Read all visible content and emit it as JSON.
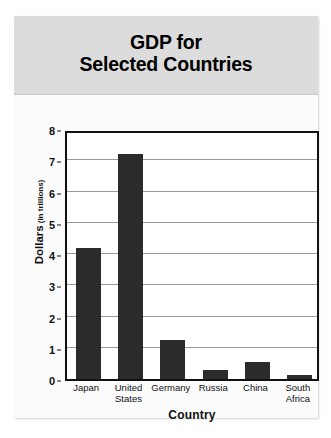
{
  "chart_data": {
    "type": "bar",
    "title": "GDP for Selected Countries",
    "title_line1": "GDP for",
    "title_line2": "Selected Countries",
    "xlabel": "Country",
    "ylabel": "Dollars",
    "ylabel_sub": "(in trillions)",
    "ylabel_full": "Dollars (in trillions)",
    "categories": [
      "Japan",
      "United States",
      "Germany",
      "Russia",
      "China",
      "South Africa"
    ],
    "category_lines": [
      [
        "Japan"
      ],
      [
        "United",
        "States"
      ],
      [
        "Germany"
      ],
      [
        "Russia"
      ],
      [
        "China"
      ],
      [
        "South",
        "Africa"
      ]
    ],
    "values": [
      4.2,
      7.2,
      1.25,
      0.3,
      0.55,
      0.12
    ],
    "ylim": [
      0,
      8
    ],
    "ytick_labels": [
      "0",
      "1",
      "2",
      "3",
      "4",
      "5",
      "6",
      "7",
      "8"
    ],
    "ytick_values": [
      0,
      1,
      2,
      3,
      4,
      5,
      6,
      7,
      8
    ],
    "grid": true,
    "legend": "none",
    "bar_color": "#2b2b2b",
    "plot_background": "#ffffff",
    "title_band_color": "#dcdcdc",
    "figure_background": "#f2f2f2",
    "axis_color": "#111111",
    "gridline_color": "#9a9a9a"
  }
}
